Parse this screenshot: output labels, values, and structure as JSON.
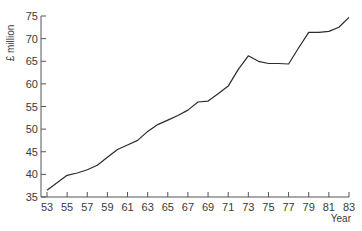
{
  "chart_data": {
    "type": "line",
    "title": "",
    "xlabel": "Year",
    "ylabel": "£ million",
    "xlim": [
      53,
      83
    ],
    "ylim": [
      35,
      75
    ],
    "grid": false,
    "legend": "none",
    "x_ticks": [
      "53",
      "55",
      "57",
      "59",
      "61",
      "63",
      "65",
      "67",
      "69",
      "71",
      "73",
      "75",
      "77",
      "79",
      "81",
      "83"
    ],
    "y_ticks": [
      "35",
      "40",
      "45",
      "50",
      "55",
      "60",
      "65",
      "70",
      "75"
    ],
    "series": [
      {
        "name": "£ million",
        "color": "#2b2b2b",
        "x": [
          53,
          55,
          56,
          57,
          58,
          59,
          60,
          61,
          62,
          63,
          64,
          65,
          66,
          67,
          68,
          69,
          70,
          71,
          72,
          73,
          74,
          75,
          76,
          77,
          78,
          79,
          80,
          81,
          82,
          83
        ],
        "values": [
          36.5,
          39.8,
          40.3,
          41.0,
          42.0,
          43.8,
          45.5,
          46.5,
          47.5,
          49.5,
          51.0,
          52.0,
          53.0,
          54.2,
          56.0,
          56.2,
          57.8,
          59.5,
          63.2,
          66.2,
          65.0,
          64.5,
          64.5,
          64.4,
          68.0,
          71.4,
          71.4,
          71.6,
          72.5,
          74.7
        ]
      }
    ]
  }
}
